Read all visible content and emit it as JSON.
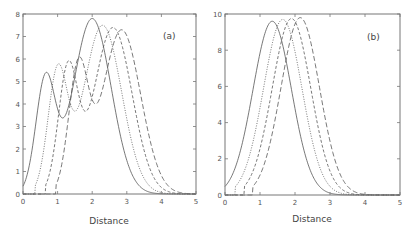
{
  "chart_data": [
    {
      "type": "line",
      "panel_label": "(a)",
      "xlabel": "Distance",
      "ylabel": "",
      "xlim": [
        0,
        5
      ],
      "ylim": [
        0,
        8
      ],
      "xticks": [
        "0",
        "1",
        "2",
        "3",
        "4",
        "5"
      ],
      "yticks": [
        "0",
        "1",
        "2",
        "3",
        "4",
        "5",
        "6",
        "7",
        "8"
      ],
      "grid": false,
      "legend": null,
      "series": [
        {
          "name": "solid",
          "style": "solid",
          "peaks": [
            {
              "x": 0.65,
              "y": 5.0
            },
            {
              "x": 2.0,
              "y": 7.8
            }
          ],
          "trough": {
            "x": 1.15,
            "y": 2.6
          }
        },
        {
          "name": "dotted",
          "style": "dotted",
          "peaks": [
            {
              "x": 1.0,
              "y": 5.3
            },
            {
              "x": 2.3,
              "y": 7.5
            }
          ],
          "trough": {
            "x": 1.5,
            "y": 2.65
          }
        },
        {
          "name": "dashed",
          "style": "dashed",
          "peaks": [
            {
              "x": 1.3,
              "y": 5.45
            },
            {
              "x": 2.6,
              "y": 7.4
            }
          ],
          "trough": {
            "x": 1.8,
            "y": 2.7
          }
        },
        {
          "name": "long-dashed",
          "style": "long-dashed",
          "peaks": [
            {
              "x": 1.6,
              "y": 5.5
            },
            {
              "x": 2.85,
              "y": 7.3
            }
          ],
          "trough": {
            "x": 2.1,
            "y": 2.7
          }
        }
      ]
    },
    {
      "type": "line",
      "panel_label": "(b)",
      "xlabel": "Distance",
      "ylabel": "",
      "xlim": [
        0,
        5
      ],
      "ylim": [
        0,
        10
      ],
      "xticks": [
        "0",
        "1",
        "2",
        "3",
        "4",
        "5"
      ],
      "yticks": [
        "0",
        "2",
        "4",
        "6",
        "8",
        "10"
      ],
      "grid": false,
      "legend": null,
      "series": [
        {
          "name": "solid",
          "style": "solid",
          "peaks": [
            {
              "x": 1.35,
              "y": 9.6
            }
          ]
        },
        {
          "name": "dotted",
          "style": "dotted",
          "peaks": [
            {
              "x": 1.65,
              "y": 9.7
            }
          ]
        },
        {
          "name": "dashed",
          "style": "dashed",
          "peaks": [
            {
              "x": 1.9,
              "y": 9.75
            }
          ]
        },
        {
          "name": "long-dashed",
          "style": "long-dashed",
          "peaks": [
            {
              "x": 2.15,
              "y": 9.8
            }
          ]
        }
      ]
    }
  ]
}
